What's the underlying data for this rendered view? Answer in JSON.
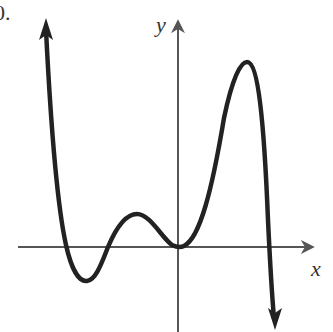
{
  "problem_number": "0.",
  "axes": {
    "x_label": "x",
    "y_label": "y",
    "color": "#555555"
  },
  "curve": {
    "color": "#222222",
    "description": "Polynomial curve: rises to +infinity on the left (arrow up), dips to a local minimum below the x-axis, rises to a small local maximum above the x-axis, touches the x-axis at the origin, rises to a tall local maximum, then falls to -infinity on the right (arrow down).",
    "features": [
      {
        "type": "end-behavior-left",
        "direction": "up"
      },
      {
        "type": "x-intercept",
        "position": "left of origin, far"
      },
      {
        "type": "local-minimum",
        "position": "below x-axis, left"
      },
      {
        "type": "x-intercept",
        "position": "left of origin, near"
      },
      {
        "type": "local-maximum",
        "position": "small, above x-axis, left of origin"
      },
      {
        "type": "touch-point",
        "position": "origin (double root)"
      },
      {
        "type": "local-maximum",
        "position": "large, right of origin"
      },
      {
        "type": "x-intercept",
        "position": "right of origin"
      },
      {
        "type": "end-behavior-right",
        "direction": "down"
      }
    ]
  }
}
